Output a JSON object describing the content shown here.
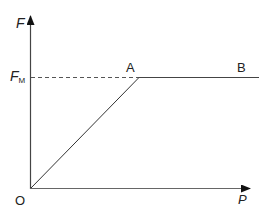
{
  "diagram": {
    "type": "force-load graph",
    "axes": {
      "y": {
        "label": "F"
      },
      "x": {
        "label": "P"
      },
      "origin": {
        "label": "O"
      }
    },
    "levels": {
      "max_force": {
        "label": "F",
        "subscript": "M"
      }
    },
    "points": [
      {
        "id": "O",
        "label": "O"
      },
      {
        "id": "A",
        "label": "A"
      },
      {
        "id": "B",
        "label": "B"
      }
    ],
    "segments": [
      {
        "from": "O",
        "to": "A",
        "style": "solid",
        "description": "linear rise"
      },
      {
        "from": "A",
        "to": "B",
        "style": "solid",
        "description": "constant at F_M"
      },
      {
        "from": "F-axis",
        "to": "A",
        "style": "dashed",
        "description": "F_M reference line"
      }
    ],
    "colors": {
      "line": "#333333",
      "axis": "#444444",
      "dashed": "#555555",
      "text": "#222222"
    }
  }
}
